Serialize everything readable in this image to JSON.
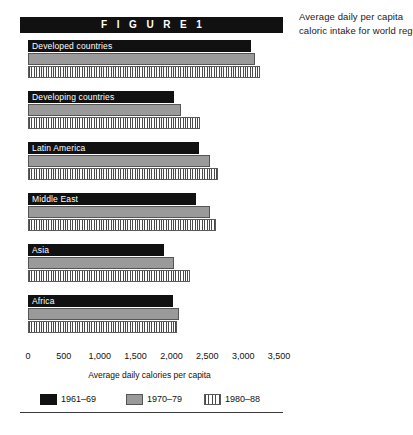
{
  "figure": {
    "title": "F I G U R E   1",
    "caption_lines": [
      "Average daily per capita",
      "caloric intake for world regions"
    ]
  },
  "axis": {
    "title": "Average daily calories per capita",
    "ticks": [
      "0",
      "500",
      "1,000",
      "1,500",
      "2,000",
      "2,500",
      "3,000",
      "3,500"
    ],
    "min": 0,
    "max": 3500
  },
  "legend": [
    {
      "label": "1961–69",
      "key": "s1961",
      "color": "#111111"
    },
    {
      "label": "1970–79",
      "key": "s1970",
      "color": "#9a9a9a"
    },
    {
      "label": "1980–88",
      "key": "s1980",
      "color": "#ffffff"
    }
  ],
  "chart_data": {
    "type": "bar",
    "orientation": "horizontal",
    "title": "Average daily per capita caloric intake for world regions",
    "xlabel": "Average daily calories per capita",
    "ylabel": "",
    "xlim": [
      0,
      3500
    ],
    "xticks": [
      0,
      500,
      1000,
      1500,
      2000,
      2500,
      3000,
      3500
    ],
    "grid": false,
    "legend_position": "bottom",
    "categories": [
      "Developed countries",
      "Developing countries",
      "Latin America",
      "Middle East",
      "Asia",
      "Africa"
    ],
    "series": [
      {
        "name": "1961–69",
        "values": [
          3110,
          2035,
          2385,
          2345,
          1895,
          2020
        ]
      },
      {
        "name": "1970–79",
        "values": [
          3165,
          2135,
          2540,
          2540,
          2035,
          2105
        ]
      },
      {
        "name": "1980–88",
        "values": [
          3235,
          2400,
          2650,
          2620,
          2260,
          2080
        ]
      }
    ]
  }
}
